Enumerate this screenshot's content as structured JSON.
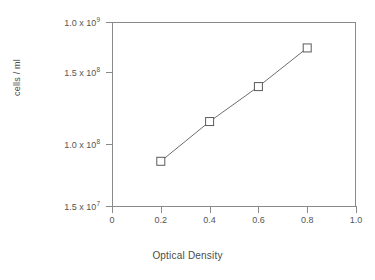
{
  "chart_data": {
    "type": "line",
    "title": "",
    "subtitle": "",
    "xlabel": "Optical Density",
    "ylabel": "cells / ml",
    "x": [
      0.2,
      0.4,
      0.6,
      0.8
    ],
    "series": [
      {
        "name": "cell density",
        "values": [
          "9.0 x 10^7",
          "1.2 x 10^8",
          "1.5 x 10^8",
          "3.0 x 10^8"
        ],
        "marker": "open-square",
        "line_color": "#6e6e6e",
        "marker_color": "#5a5a5a"
      }
    ],
    "xlim": [
      0.0,
      1.0
    ],
    "xticks": [
      {
        "value": 0.0,
        "label": "0"
      },
      {
        "value": 0.2,
        "label": "0.2"
      },
      {
        "value": 0.4,
        "label": "0.4"
      },
      {
        "value": 0.6,
        "label": "0.6"
      },
      {
        "value": 0.8,
        "label": "0.8"
      },
      {
        "value": 1.0,
        "label": "1.0"
      }
    ],
    "yticks": [
      {
        "mantissa": "1.0",
        "exponent": "9",
        "label": "1.0 x 10",
        "pos": 0.0
      },
      {
        "mantissa": "1.5",
        "exponent": "8",
        "label": "1.5 x 10",
        "pos": 0.27
      },
      {
        "mantissa": "1.0",
        "exponent": "8",
        "label": "1.0 x 10",
        "pos": 0.665
      },
      {
        "mantissa": "1.5",
        "exponent": "7",
        "label": "1.5 x 10",
        "pos": 1.0
      }
    ],
    "points_pixel": [
      {
        "x": 0.2,
        "px": 0.2,
        "py": 0.757
      },
      {
        "x": 0.4,
        "px": 0.4,
        "py": 0.541
      },
      {
        "x": 0.6,
        "px": 0.6,
        "py": 0.351
      },
      {
        "x": 0.8,
        "px": 0.8,
        "py": 0.141
      }
    ],
    "grid": false,
    "legend": "none",
    "frame": "top-left-bottom-right-ticks",
    "colors": {
      "axis": "#8a8a8a",
      "text": "#4a4a4a",
      "tick_text": "#555555",
      "background": "#ffffff"
    }
  }
}
